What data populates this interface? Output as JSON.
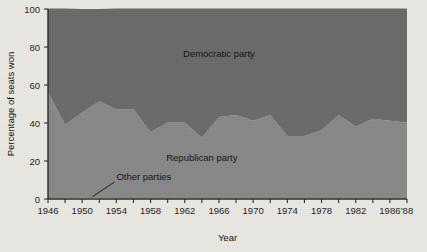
{
  "chart_data": {
    "type": "area",
    "title": "",
    "subtitle": "",
    "xlabel": "Year",
    "ylabel": "Percentage of seats won",
    "xlim": [
      1946,
      1988
    ],
    "ylim": [
      0,
      100
    ],
    "grid": false,
    "legend_position": "inline-annotations",
    "stacked": true,
    "x": [
      1946,
      1948,
      1950,
      1952,
      1954,
      1956,
      1958,
      1960,
      1962,
      1964,
      1966,
      1968,
      1970,
      1972,
      1974,
      1976,
      1978,
      1980,
      1982,
      1984,
      1986,
      1988
    ],
    "xticks": [
      1946,
      1950,
      1954,
      1958,
      1962,
      1966,
      1970,
      1974,
      1978,
      1982,
      1986,
      1988
    ],
    "xticklabels": [
      "1946",
      "1950",
      "1954",
      "1958",
      "1962",
      "1966",
      "1970",
      "1974",
      "1978",
      "1982",
      "1986",
      "'88"
    ],
    "yticks": [
      0,
      20,
      40,
      60,
      80,
      100
    ],
    "yticklabels": [
      "0",
      "20",
      "40",
      "60",
      "80",
      "100"
    ],
    "series": [
      {
        "name": "Other parties",
        "label": "Other parties",
        "color": "#d8d4cd",
        "values": [
          0.2,
          0.2,
          0.5,
          0.5,
          0.2,
          0.2,
          0.2,
          0.2,
          0.2,
          0.2,
          0.2,
          0.2,
          0.2,
          0.2,
          0.2,
          0.2,
          0.2,
          0.2,
          0.2,
          0.2,
          0.2,
          0.2
        ]
      },
      {
        "name": "Republican party",
        "label": "Republican party",
        "color": "#898989",
        "values": [
          56,
          39,
          45,
          51,
          47,
          47,
          35,
          40,
          40,
          32,
          43,
          44,
          41,
          44,
          33,
          33,
          36,
          44,
          38,
          42,
          41,
          40
        ]
      },
      {
        "name": "Democratic party",
        "label": "Democratic party",
        "color": "#6b6b6b",
        "values": [
          44,
          61,
          54.5,
          48.5,
          53,
          53,
          65,
          60,
          60,
          68,
          57,
          56,
          59,
          56,
          67,
          67,
          64,
          56,
          62,
          58,
          59,
          60
        ]
      }
    ],
    "annotations": [
      {
        "text": "Democratic party",
        "x": 1966,
        "y": 75
      },
      {
        "text": "Republican party",
        "x": 1964,
        "y": 20
      },
      {
        "text": "Other parties",
        "x": 1954,
        "y": 10
      }
    ]
  },
  "colors": {
    "background": "#ece9e4",
    "democratic": "#6b6b6b",
    "republican": "#898989",
    "other": "#d8d4cd",
    "axis": "#2a2a2a",
    "text": "#121212"
  }
}
